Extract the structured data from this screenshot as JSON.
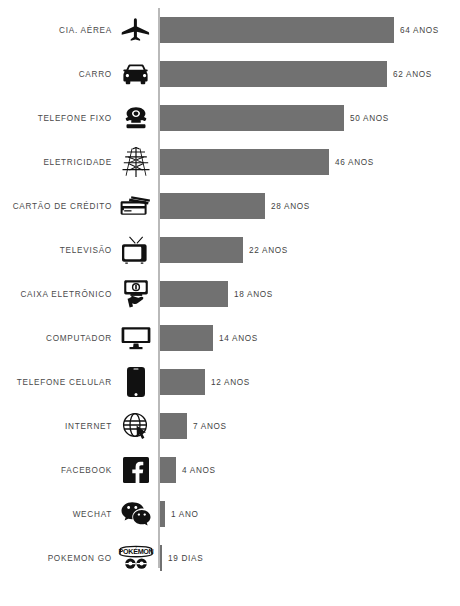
{
  "chart_data": {
    "type": "bar",
    "orientation": "horizontal",
    "title": "",
    "subtitle": "",
    "xlabel": "",
    "ylabel": "",
    "grid": false,
    "legend": false,
    "axis_baseline": 0,
    "unit_note": "Valores em anos, exceto Pokemon Go (dias)",
    "categories": [
      "CIA. AÉREA",
      "CARRO",
      "TELEFONE FIXO",
      "ELETRICIDADE",
      "CARTÃO DE CRÉDITO",
      "TELEVISÃO",
      "CAIXA ELETRÔNICO",
      "COMPUTADOR",
      "TELEFONE CELULAR",
      "INTERNET",
      "FACEBOOK",
      "WECHAT",
      "POKEMON GO"
    ],
    "values": [
      64,
      62,
      50,
      46,
      28,
      22,
      18,
      14,
      12,
      7,
      4,
      1,
      0.052
    ],
    "value_labels": [
      "64 ANOS",
      "62 ANOS",
      "50 ANOS",
      "46 ANOS",
      "28 ANOS",
      "22 ANOS",
      "18 ANOS",
      "14 ANOS",
      "12 ANOS",
      "7 ANOS",
      "4 ANOS",
      "1 ANO",
      "19 DIAS"
    ],
    "xlim": [
      0,
      64
    ],
    "bar_color": "#717171",
    "axis_color": "#b9b9b9",
    "background": "#ffffff"
  },
  "rows": [
    {
      "label": "CIA. AÉREA",
      "value_label": "64 ANOS",
      "bar_px": 234,
      "icon": "airplane-icon"
    },
    {
      "label": "CARRO",
      "value_label": "62 ANOS",
      "bar_px": 227,
      "icon": "car-icon"
    },
    {
      "label": "TELEFONE FIXO",
      "value_label": "50 ANOS",
      "bar_px": 184,
      "icon": "landline-phone-icon"
    },
    {
      "label": "ELETRICIDADE",
      "value_label": "46 ANOS",
      "bar_px": 169,
      "icon": "power-pylon-icon"
    },
    {
      "label": "CARTÃO DE CRÉDITO",
      "value_label": "28 ANOS",
      "bar_px": 105,
      "icon": "credit-card-icon"
    },
    {
      "label": "TELEVISÃO",
      "value_label": "22 ANOS",
      "bar_px": 83,
      "icon": "television-icon"
    },
    {
      "label": "CAIXA ELETRÔNICO",
      "value_label": "18 ANOS",
      "bar_px": 68,
      "icon": "atm-icon"
    },
    {
      "label": "COMPUTADOR",
      "value_label": "14 ANOS",
      "bar_px": 53,
      "icon": "desktop-computer-icon"
    },
    {
      "label": "TELEFONE CELULAR",
      "value_label": "12 ANOS",
      "bar_px": 45,
      "icon": "smartphone-icon"
    },
    {
      "label": "INTERNET",
      "value_label": "7 ANOS",
      "bar_px": 27,
      "icon": "globe-cursor-icon"
    },
    {
      "label": "FACEBOOK",
      "value_label": "4 ANOS",
      "bar_px": 16,
      "icon": "facebook-icon"
    },
    {
      "label": "WECHAT",
      "value_label": "1 ANO",
      "bar_px": 5,
      "icon": "wechat-icon"
    },
    {
      "label": "POKEMON GO",
      "value_label": "19 DIAS",
      "bar_px": 2,
      "icon": "pokemon-go-icon"
    }
  ]
}
